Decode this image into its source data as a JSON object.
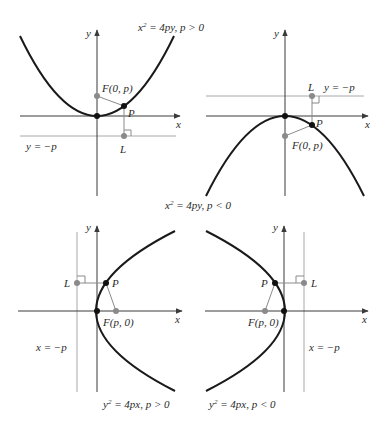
{
  "figure": {
    "panels": [
      {
        "id": "top-left",
        "equation_label": "x² = 4py, p > 0",
        "equation": {
          "var": "x",
          "exp": "2",
          "rhs": " = 4py, p > 0"
        },
        "axis_x": "x",
        "axis_y": "y",
        "focus_label": "F(0, p)",
        "point_label": "P",
        "directrix_point_label": "L",
        "directrix_label": "y = −p",
        "opens": "up"
      },
      {
        "id": "top-right",
        "equation_label": "x² = 4py, p < 0",
        "equation": {
          "var": "x",
          "exp": "2",
          "rhs": " = 4py, p < 0"
        },
        "axis_x": "x",
        "axis_y": "y",
        "focus_label": "F(0, p)",
        "point_label": "P",
        "directrix_point_label": "L",
        "directrix_label": "y = −p",
        "opens": "down"
      },
      {
        "id": "bottom-left",
        "equation_label": "y² = 4px, p > 0",
        "equation": {
          "var": "y",
          "exp": "2",
          "rhs": " = 4px, p > 0"
        },
        "axis_x": "x",
        "axis_y": "y",
        "focus_label": "F(p, 0)",
        "point_label": "P",
        "directrix_point_label": "L",
        "directrix_label": "x = −p",
        "opens": "right"
      },
      {
        "id": "bottom-right",
        "equation_label": "y² = 4px, p < 0",
        "equation": {
          "var": "y",
          "exp": "2",
          "rhs": " = 4px, p < 0"
        },
        "axis_x": "x",
        "axis_y": "y",
        "focus_label": "F(p, 0)",
        "point_label": "P",
        "directrix_point_label": "L",
        "directrix_label": "x = −p",
        "opens": "left"
      }
    ],
    "colors": {
      "curve": "#1a1a1a",
      "axis": "#3a3a3a",
      "guide": "#a8a8a8",
      "gray_point": "#8a8a8a",
      "black_point": "#111111"
    }
  }
}
